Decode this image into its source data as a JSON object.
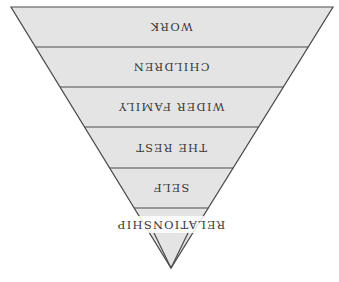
{
  "diagram": {
    "type": "inverted-pyramid",
    "orientation_note": "whole figure rendered rotated 180 degrees (text upside down)",
    "colors": {
      "fill": "#e4e4e4",
      "stroke": "#4a4a4a",
      "text": "#3a3a3a",
      "label_background": "#ffffff"
    },
    "levels": [
      {
        "label": "WORK"
      },
      {
        "label": "CHILDREN"
      },
      {
        "label": "WIDER FAMILY"
      },
      {
        "label": "THE REST"
      },
      {
        "label": "SELF"
      },
      {
        "label": "RELATIONSHIP"
      }
    ]
  }
}
